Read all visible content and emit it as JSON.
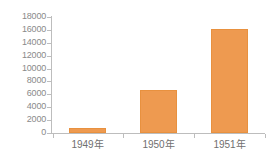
{
  "chart_data": {
    "type": "bar",
    "title": "",
    "subtitle": "",
    "xlabel": "",
    "ylabel": "",
    "categories": [
      "1949年",
      "1950年",
      "1951年"
    ],
    "values": [
      750,
      6700,
      16200
    ],
    "series": [
      {
        "name": "",
        "values": [
          750,
          6700,
          16200
        ],
        "color": "#ee9a50"
      }
    ],
    "ylim": [
      0,
      18000
    ],
    "ytick_step": 2000,
    "yticks": [
      0,
      2000,
      4000,
      6000,
      8000,
      10000,
      12000,
      14000,
      16000,
      18000
    ],
    "ytick_labels": [
      "0",
      "2000",
      "4000",
      "6000",
      "8000",
      "10000",
      "12000",
      "14000",
      "16000",
      "18000"
    ],
    "grid": false,
    "legend": null,
    "legend_position": "none",
    "annotations": []
  },
  "style": {
    "background": "#ffffff",
    "bar_color": "#ee9a50",
    "bar_border_color": "#e8913f",
    "axis_color": "#bdbdbd",
    "ytick_label_color": "#8a8a8a",
    "xtick_label_color": "#6f6f6f"
  }
}
